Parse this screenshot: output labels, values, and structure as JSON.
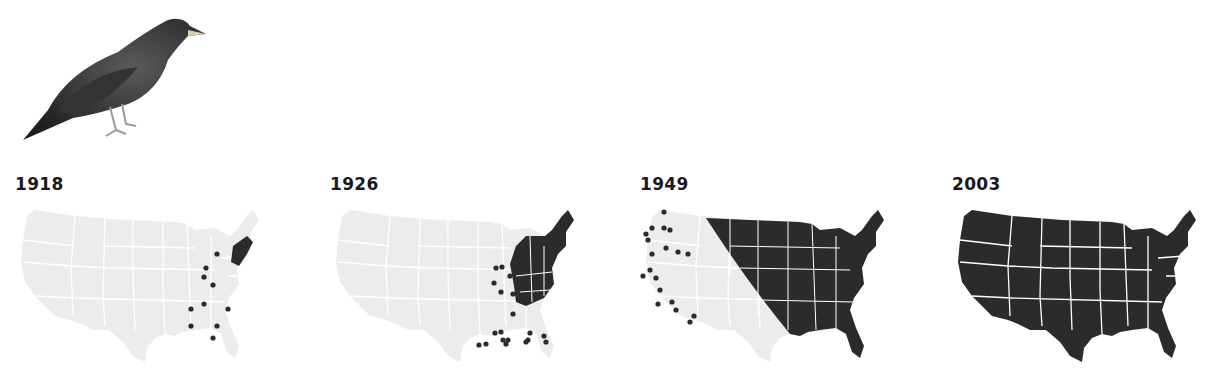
{
  "title_image": {
    "subject": "European starling",
    "icon": "starling-bird-illustration"
  },
  "colors": {
    "occupied": "#2b2b2b",
    "unoccupied": "#ececec",
    "border": "#ffffff",
    "dot": "#2b2b2b"
  },
  "panels": [
    {
      "year": "1918",
      "occupied_region": "coastal-northeast",
      "dots": 11
    },
    {
      "year": "1926",
      "occupied_region": "east-of-appalachians",
      "dots": 24
    },
    {
      "year": "1949",
      "occupied_region": "east-of-rockies",
      "dots": 22
    },
    {
      "year": "2003",
      "occupied_region": "entire-contiguous-us",
      "dots": 0
    }
  ]
}
